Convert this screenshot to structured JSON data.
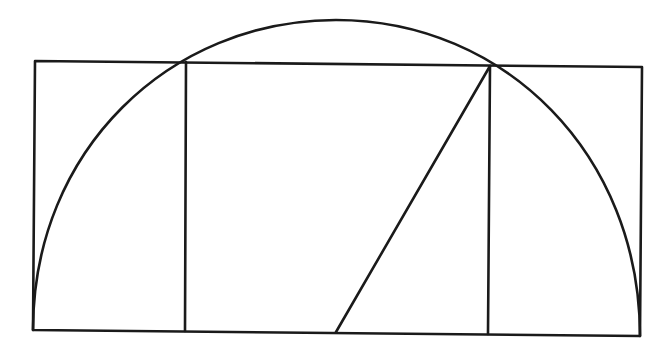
{
  "diagram": {
    "stroke_color": "#1a1a1a",
    "background_color": "#ffffff",
    "elements": [
      {
        "id": "outer-rectangle",
        "kind": "rectangle"
      },
      {
        "id": "left-divider",
        "kind": "line"
      },
      {
        "id": "right-divider",
        "kind": "line"
      },
      {
        "id": "diagonal",
        "kind": "line",
        "from": "midpoint of square base",
        "to": "upper-right corner of square"
      },
      {
        "id": "semicircle-arc",
        "kind": "arc",
        "center": "midpoint of square base"
      }
    ]
  }
}
